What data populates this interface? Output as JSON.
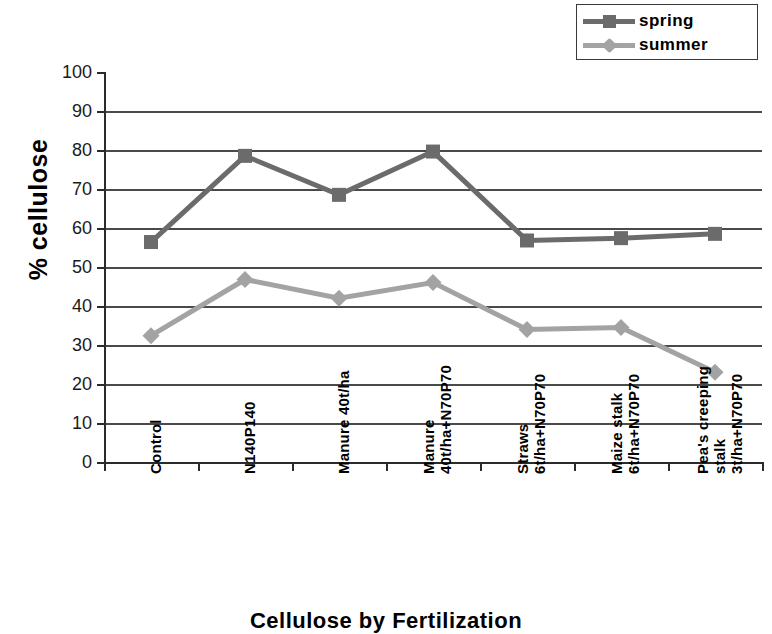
{
  "chart_data": {
    "type": "line",
    "title": "",
    "xlabel": "Cellulose by Fertilization",
    "ylabel": "% cellulose",
    "ylim": [
      0,
      100
    ],
    "ystep": 10,
    "grid": true,
    "legend_position": "top-right",
    "ytick_labels": [
      "100",
      "90",
      "80",
      "70",
      "60",
      "50",
      "40",
      "30",
      "20",
      "10",
      "0"
    ],
    "categories": [
      "Control",
      "N140P140",
      "Manure 40t/ha",
      "Manure 40t/ha+N70P70",
      "Straws 6t/ha+N70P70",
      "Maize stalk 6t/ha+N70P70",
      "Pea's creeping stalk 3t/ha+N70P70"
    ],
    "category_lines": [
      [
        "Control"
      ],
      [
        "N140P140"
      ],
      [
        "Manure 40t/ha"
      ],
      [
        "Manure",
        "40t/ha+N70P70"
      ],
      [
        "Straws",
        "6t/ha+N70P70"
      ],
      [
        "Maize stalk",
        "6t/ha+N70P70"
      ],
      [
        "Pea's creeping",
        "stalk",
        "3t/ha+N70P70"
      ]
    ],
    "series": [
      {
        "name": "spring",
        "color": "#6b6b6b",
        "marker": "square",
        "values": [
          56.4,
          78.5,
          68.5,
          79.6,
          56.8,
          57.4,
          58.5
        ]
      },
      {
        "name": "summer",
        "color": "#a3a3a3",
        "marker": "diamond",
        "values": [
          32.4,
          46.8,
          42.0,
          46.0,
          34.0,
          34.5,
          23.0
        ]
      }
    ]
  },
  "legend": {
    "items": [
      {
        "label": "spring"
      },
      {
        "label": "summer"
      }
    ]
  },
  "colors": {
    "spring": "#6b6b6b",
    "summer": "#a3a3a3",
    "grid": "#4a4a4a",
    "axis": "#2b2b2b"
  }
}
